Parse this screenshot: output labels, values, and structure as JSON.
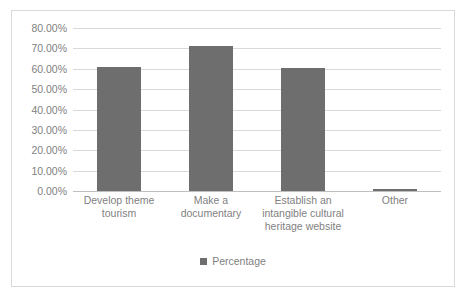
{
  "chart_data": {
    "type": "bar",
    "title": "",
    "subtitle": "",
    "xlabel": "",
    "ylabel": "",
    "categories": [
      "Develop theme tourism",
      "Make a documentary",
      "Establish an intangible cultural heritage website",
      "Other"
    ],
    "series": [
      {
        "name": "Percentage",
        "values": [
          60.8,
          71.0,
          60.3,
          1.2
        ],
        "color": "#6e6e6e"
      }
    ],
    "ylim": [
      0,
      80
    ],
    "ytick_values": [
      80,
      70,
      60,
      50,
      40,
      30,
      20,
      10,
      0
    ],
    "ytick_labels": [
      "80.00%",
      "70.00%",
      "60.00%",
      "50.00%",
      "40.00%",
      "30.00%",
      "20.00%",
      "10.00%",
      "0.00%"
    ],
    "grid": true,
    "legend_position": "bottom",
    "legend_entries": [
      "Percentage"
    ]
  },
  "category_lines": [
    [
      "Develop theme",
      "tourism"
    ],
    [
      "Make a",
      "documentary"
    ],
    [
      "Establish an",
      "intangible cultural",
      "heritage website"
    ],
    [
      "Other"
    ]
  ],
  "legend": {
    "series_label": "Percentage",
    "swatch_icon": "legend-square-icon"
  },
  "colors": {
    "bar": "#6e6e6e",
    "gridline": "#d9d9d9",
    "axis": "#bfbfbf",
    "text": "#7f7f7f",
    "frame_border": "#d9d9d9",
    "background": "#ffffff"
  }
}
